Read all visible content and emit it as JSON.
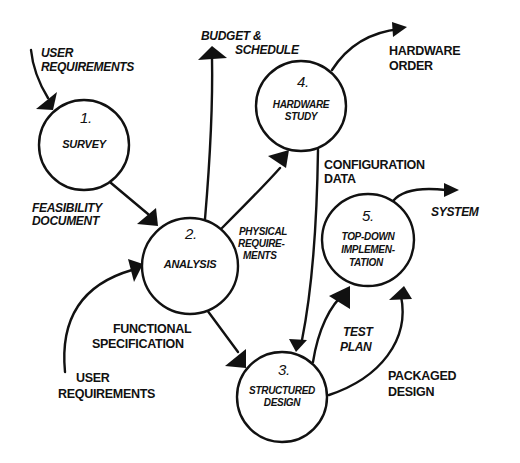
{
  "diagram": {
    "type": "data-flow-diagram",
    "style": "hand-drawn",
    "colors": {
      "ink": "#111111",
      "background": "#ffffff"
    },
    "processes": [
      {
        "number": "1.",
        "name_lines": [
          "SURVEY"
        ]
      },
      {
        "number": "2.",
        "name_lines": [
          "ANALYSIS"
        ]
      },
      {
        "number": "3.",
        "name_lines": [
          "STRUCTURED",
          "DESIGN"
        ]
      },
      {
        "number": "4.",
        "name_lines": [
          "HARDWARE",
          "STUDY"
        ]
      },
      {
        "number": "5.",
        "name_lines": [
          "TOP-DOWN",
          "IMPLEMEN-",
          "TATION"
        ]
      }
    ],
    "flows": [
      {
        "label_lines": [
          "USER",
          "REQUIREMENTS"
        ],
        "from": "external",
        "to": "1. SURVEY"
      },
      {
        "label_lines": [
          "FEASIBILITY",
          "DOCUMENT"
        ],
        "from": "1. SURVEY",
        "to": "2. ANALYSIS"
      },
      {
        "label_lines": [
          "BUDGET &",
          "SCHEDULE"
        ],
        "from": "2. ANALYSIS",
        "to": "external"
      },
      {
        "label_lines": [
          "PHYSICAL",
          "REQUIRE-",
          "MENTS"
        ],
        "from": "2. ANALYSIS",
        "to": "4. HARDWARE STUDY"
      },
      {
        "label_lines": [
          "HARDWARE",
          "ORDER"
        ],
        "from": "4. HARDWARE STUDY",
        "to": "external"
      },
      {
        "label_lines": [
          "CONFIGURATION",
          "DATA"
        ],
        "from": "4. HARDWARE STUDY",
        "to": "3. STRUCTURED DESIGN"
      },
      {
        "label_lines": [
          "USER",
          "REQUIREMENTS"
        ],
        "from": "external",
        "to": "2. ANALYSIS"
      },
      {
        "label_lines": [
          "FUNCTIONAL",
          "SPECIFICATION"
        ],
        "from": "2. ANALYSIS",
        "to": "3. STRUCTURED DESIGN"
      },
      {
        "label_lines": [
          "TEST",
          "PLAN"
        ],
        "from": "3. STRUCTURED DESIGN",
        "to": "5. TOP-DOWN IMPLEMENTATION"
      },
      {
        "label_lines": [
          "PACKAGED",
          "DESIGN"
        ],
        "from": "3. STRUCTURED DESIGN",
        "to": "5. TOP-DOWN IMPLEMENTATION"
      },
      {
        "label_lines": [
          "SYSTEM"
        ],
        "from": "5. TOP-DOWN IMPLEMENTATION",
        "to": "external"
      }
    ]
  }
}
